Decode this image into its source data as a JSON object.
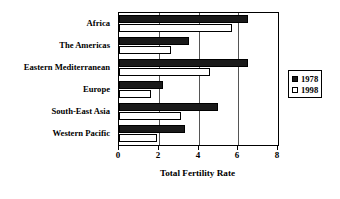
{
  "chart_data": {
    "type": "bar",
    "orientation": "horizontal",
    "title": "",
    "xlabel": "Total Fertility Rate",
    "ylabel": "",
    "xlim": [
      0,
      8
    ],
    "xticks": [
      0,
      2,
      4,
      6,
      8
    ],
    "xticklabels": [
      "0",
      "2",
      "4",
      "6",
      "8"
    ],
    "grid": "vertical",
    "legend_position": "right",
    "categories": [
      "Africa",
      "The Americas",
      "Eastern Mediterranean",
      "Europe",
      "South-East Asia",
      "Western Pacific"
    ],
    "series": [
      {
        "name": "1978",
        "color": "#1a1a1a",
        "values": [
          6.5,
          3.5,
          6.5,
          2.2,
          5.0,
          3.3
        ]
      },
      {
        "name": "1998",
        "color": "#ffffff",
        "values": [
          5.7,
          2.6,
          4.6,
          1.6,
          3.1,
          1.9
        ]
      }
    ]
  },
  "legend": {
    "entries": [
      {
        "label": "1978",
        "swatch": "filled-square"
      },
      {
        "label": "1998",
        "swatch": "open-square"
      }
    ]
  },
  "colors": {
    "series_1978": "#1a1a1a",
    "series_1998": "#ffffff",
    "axis": "#000000",
    "grid": "#555555",
    "background": "#ffffff"
  }
}
